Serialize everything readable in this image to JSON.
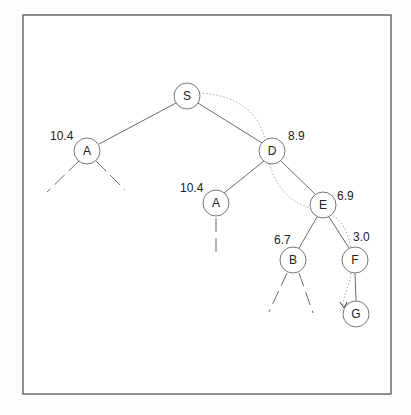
{
  "diagram": {
    "type": "search-tree",
    "nodes": [
      {
        "id": "S",
        "label": "S",
        "cost": "",
        "x": 187,
        "y": 96
      },
      {
        "id": "A1",
        "label": "A",
        "cost": "10.4",
        "x": 87,
        "y": 151
      },
      {
        "id": "D",
        "label": "D",
        "cost": "8.9",
        "x": 272,
        "y": 151
      },
      {
        "id": "A2",
        "label": "A",
        "cost": "10.4",
        "x": 216,
        "y": 203
      },
      {
        "id": "E",
        "label": "E",
        "cost": "6.9",
        "x": 323,
        "y": 205
      },
      {
        "id": "B",
        "label": "B",
        "cost": "6.7",
        "x": 293,
        "y": 260
      },
      {
        "id": "F",
        "label": "F",
        "cost": "3.0",
        "x": 355,
        "y": 260
      },
      {
        "id": "G",
        "label": "G",
        "cost": "",
        "x": 356,
        "y": 314
      }
    ],
    "edges": [
      {
        "from": "S",
        "to": "A1",
        "style": "solid"
      },
      {
        "from": "S",
        "to": "D",
        "style": "solid"
      },
      {
        "from": "D",
        "to": "A2",
        "style": "solid"
      },
      {
        "from": "D",
        "to": "E",
        "style": "solid"
      },
      {
        "from": "E",
        "to": "B",
        "style": "solid"
      },
      {
        "from": "E",
        "to": "F",
        "style": "solid"
      },
      {
        "from": "F",
        "to": "G",
        "style": "solid"
      }
    ],
    "unexpanded_branches": [
      {
        "from": "A1",
        "direction": "left"
      },
      {
        "from": "A1",
        "direction": "right"
      },
      {
        "from": "A2",
        "direction": "down"
      },
      {
        "from": "B",
        "direction": "left"
      },
      {
        "from": "B",
        "direction": "right"
      }
    ],
    "search_path": [
      "S",
      "D",
      "E",
      "F",
      "G"
    ],
    "labels": {
      "S": "S",
      "A1": "A",
      "D": "D",
      "A2": "A",
      "E": "E",
      "B": "B",
      "F": "F",
      "G": "G"
    },
    "costs": {
      "A1": "10.4",
      "D": "8.9",
      "A2": "10.4",
      "E": "6.9",
      "B": "6.7",
      "F": "3.0"
    }
  }
}
